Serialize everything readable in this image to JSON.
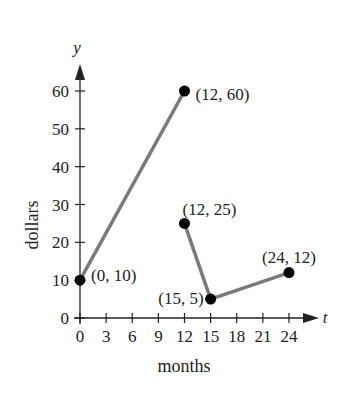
{
  "chart_data": {
    "type": "line",
    "title": "",
    "xlabel": "months",
    "ylabel": "dollars",
    "x_axis_var": "t",
    "y_axis_var": "y",
    "xlim": [
      0,
      24
    ],
    "ylim": [
      0,
      60
    ],
    "x_ticks": [
      0,
      3,
      6,
      9,
      12,
      15,
      18,
      21,
      24
    ],
    "y_ticks": [
      0,
      10,
      20,
      30,
      40,
      50,
      60
    ],
    "grid": false,
    "legend": null,
    "series": [
      {
        "name": "segment-1",
        "points": [
          [
            0,
            10
          ],
          [
            12,
            60
          ]
        ]
      },
      {
        "name": "segment-2",
        "points": [
          [
            12,
            25
          ],
          [
            15,
            5
          ],
          [
            24,
            12
          ]
        ]
      }
    ],
    "annotations": [
      {
        "x": 0,
        "y": 10,
        "label": "(0, 10)"
      },
      {
        "x": 12,
        "y": 60,
        "label": "(12, 60)"
      },
      {
        "x": 12,
        "y": 25,
        "label": "(12, 25)"
      },
      {
        "x": 15,
        "y": 5,
        "label": "(15, 5)"
      },
      {
        "x": 24,
        "y": 12,
        "label": "(24, 12)"
      }
    ],
    "colors": {
      "line": "#7a7a7a",
      "point": "#000000",
      "axis": "#222222"
    }
  }
}
